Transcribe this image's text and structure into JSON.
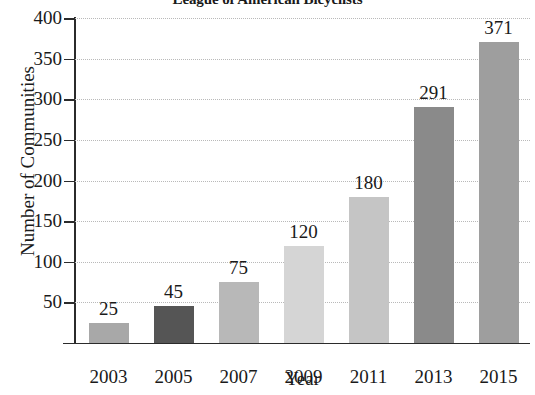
{
  "chart_data": {
    "type": "bar",
    "title": "League of American Bicyclists",
    "xlabel": "Year",
    "ylabel": "Number of Communities",
    "categories": [
      "2003",
      "2005",
      "2007",
      "2009",
      "2011",
      "2013",
      "2015"
    ],
    "values": [
      25,
      45,
      75,
      120,
      180,
      291,
      371
    ],
    "value_labels": [
      "25",
      "45",
      "75",
      "120",
      "180",
      "291",
      "371"
    ],
    "bar_colors": [
      "#a8a8a8",
      "#555555",
      "#b8b8b8",
      "#d5d5d5",
      "#c5c5c5",
      "#8a8a8a",
      "#9e9e9e"
    ],
    "ylim": [
      0,
      400
    ],
    "ytick_labels": [
      "400",
      "350",
      "300",
      "250",
      "200",
      "150",
      "100",
      "50"
    ],
    "ytick_values": [
      400,
      350,
      300,
      250,
      200,
      150,
      100,
      50
    ],
    "grid": true,
    "legend": null
  }
}
